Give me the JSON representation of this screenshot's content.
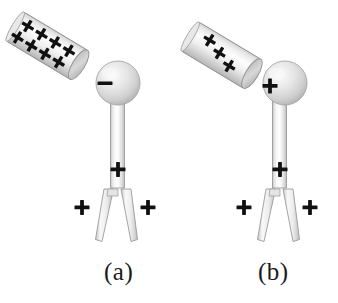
{
  "figure": {
    "background_color": "#ffffff",
    "ink_color": "#1b1b1b",
    "body_fill_light": "#f2f2f2",
    "body_fill_mid": "#dcdcdc",
    "body_fill_dark": "#bdbdbd",
    "outline_color": "#8c8c8c",
    "panels": [
      {
        "id": "a",
        "label": "(a)",
        "rod": {
          "name": "charged-rod",
          "charge_symbol": "+",
          "charge_count": 8,
          "charge_rows": [
            {
              "symbols": [
                "+",
                "+",
                "+",
                "+"
              ]
            },
            {
              "symbols": [
                "+",
                "+",
                "+",
                "+"
              ]
            }
          ],
          "touching_sphere": false,
          "angle_deg": -31
        },
        "electroscope": {
          "name": "electroscope",
          "knob": {
            "name": "electroscope-knob",
            "charge_symbol": "−"
          },
          "stem": {
            "name": "electroscope-stem",
            "charge_symbol": "+"
          },
          "leaves": {
            "name": "electroscope-leaves",
            "left_charge_symbol": "+",
            "right_charge_symbol": "+",
            "diverged": true
          }
        }
      },
      {
        "id": "b",
        "label": "(b)",
        "rod": {
          "name": "charged-rod",
          "charge_symbol": "+",
          "charge_count": 3,
          "charge_rows": [
            {
              "symbols": [
                "+",
                "+",
                "+"
              ]
            }
          ],
          "touching_sphere": true,
          "angle_deg": -31
        },
        "electroscope": {
          "name": "electroscope",
          "knob": {
            "name": "electroscope-knob",
            "charge_symbol": "+"
          },
          "stem": {
            "name": "electroscope-stem",
            "charge_symbol": "+"
          },
          "leaves": {
            "name": "electroscope-leaves",
            "left_charge_symbol": "+",
            "right_charge_symbol": "+",
            "diverged": true
          }
        }
      }
    ]
  }
}
